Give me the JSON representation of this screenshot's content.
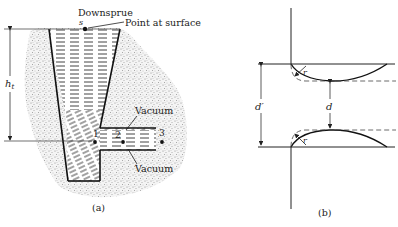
{
  "figure": {
    "panel_a": {
      "caption": "(a)",
      "downsprue_label": "Downsprue",
      "surface_point_letter": "s",
      "surface_point_label": "Point at surface",
      "height_label_main": "h",
      "height_label_sub": "t",
      "vacuum_top_label": "Vacuum",
      "vacuum_bottom_label": "Vacuum",
      "points": [
        "1",
        "2",
        "3"
      ]
    },
    "panel_b": {
      "caption": "(b)",
      "outer_gap_label": "d′",
      "inner_gap_label": "d",
      "radius_top_label": "r",
      "radius_bottom_label": "r"
    },
    "colors": {
      "ink": "#222222",
      "sand": "#bdbdbd",
      "metal_hatch": "#333333"
    }
  }
}
